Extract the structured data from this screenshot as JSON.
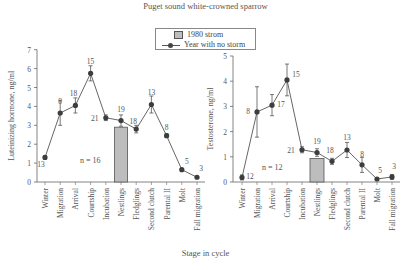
{
  "chart_data": [
    {
      "type": "line",
      "title": "Puget sound white-crowned sparrow",
      "xlabel": "Stage in cycle",
      "ylabel": "Luteinizing hormone, ng/ml",
      "ylim": [
        0,
        7
      ],
      "yticks": [
        0,
        1,
        2,
        3,
        4,
        5,
        6,
        7
      ],
      "categories": [
        "Winter",
        "Migration",
        "Arrival",
        "Courtship",
        "Incubation",
        "Nestlings",
        "Fledglings",
        "Second clutch",
        "Parental II",
        "Molt",
        "Fall migration"
      ],
      "series": [
        {
          "name": "Year with no storm",
          "type": "line",
          "values": [
            1.3,
            3.65,
            4.05,
            5.75,
            3.4,
            3.25,
            2.8,
            4.1,
            2.45,
            0.65,
            0.25
          ],
          "errors": [
            0.1,
            0.65,
            0.4,
            0.4,
            0.15,
            0.3,
            0.2,
            0.45,
            0.1,
            0.05,
            0.05
          ],
          "n_labels": [
            "13",
            "8",
            "18",
            "15",
            "21",
            "19",
            "18",
            "13",
            "8",
            "5",
            "3"
          ]
        },
        {
          "name": "1980 strom",
          "type": "bar",
          "category": "Nestlings",
          "value": 2.9,
          "annotation": "n = 16"
        }
      ]
    },
    {
      "type": "line",
      "ylabel": "Testosterone, ng/ml",
      "ylim": [
        0,
        5
      ],
      "yticks": [
        0,
        1,
        2,
        3,
        4,
        5
      ],
      "categories": [
        "Winter",
        "Migration",
        "Arrival",
        "Courtship",
        "Incubation",
        "Nestlings",
        "Fledglings",
        "Second clutch",
        "Parental II",
        "Molt",
        "Fall migration"
      ],
      "series": [
        {
          "name": "Year with no storm",
          "type": "line",
          "values": [
            0.18,
            2.78,
            3.05,
            4.05,
            1.28,
            1.17,
            0.82,
            1.27,
            0.68,
            0.12,
            0.2
          ],
          "errors": [
            0.1,
            1.0,
            0.42,
            0.63,
            0.12,
            0.15,
            0.12,
            0.3,
            0.3,
            0.05,
            0.1
          ],
          "n_labels": [
            "12",
            "8",
            "17",
            "15",
            "21",
            "19",
            "18",
            "13",
            "8",
            "5",
            "3"
          ]
        },
        {
          "name": "1980 strom",
          "type": "bar",
          "category": "Nestlings",
          "value": 0.93,
          "annotation": "n = 12"
        }
      ]
    }
  ],
  "figure": {
    "title": "Puget sound white-crowned sparrow",
    "xlabel": "Stage in cycle",
    "legend": [
      {
        "label": "1980 strom",
        "symbol": "gray-bar"
      },
      {
        "label": "Year with no storm",
        "symbol": "line-dot"
      }
    ]
  }
}
